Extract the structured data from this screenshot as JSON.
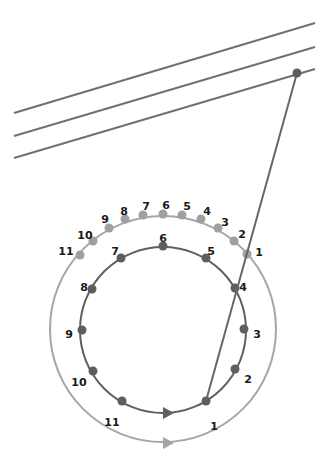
{
  "diagram": {
    "colors": {
      "background": "#ffffff",
      "parallel_lines": "#707070",
      "inner_circle": "#606060",
      "inner_dots": "#5e5e5e",
      "outer_circle": "#a6a6a6",
      "outer_dots": "#a0a0a0",
      "connector": "#666666",
      "label": "#1a1a1a"
    },
    "parallel_lines": [
      {
        "x1": 14,
        "y1": 113,
        "x2": 315,
        "y2": 23
      },
      {
        "x1": 14,
        "y1": 136,
        "x2": 315,
        "y2": 47
      },
      {
        "x1": 14,
        "y1": 158,
        "x2": 315,
        "y2": 69
      }
    ],
    "connector": {
      "x1": 297,
      "y1": 73,
      "x2": 206,
      "y2": 401,
      "top_dot": {
        "x": 297,
        "y": 73
      }
    },
    "inner_circle": {
      "cx": 163,
      "cy": 330,
      "r": 83,
      "points": [
        {
          "label": "1",
          "x": 206,
          "y": 401,
          "lx": 214,
          "ly": 426
        },
        {
          "label": "2",
          "x": 235,
          "y": 369,
          "lx": 248,
          "ly": 379
        },
        {
          "label": "3",
          "x": 244,
          "y": 329,
          "lx": 257,
          "ly": 334
        },
        {
          "label": "4",
          "x": 235,
          "y": 288,
          "lx": 243,
          "ly": 287
        },
        {
          "label": "5",
          "x": 206,
          "y": 258,
          "lx": 211,
          "ly": 251
        },
        {
          "label": "6",
          "x": 163,
          "y": 246,
          "lx": 163,
          "ly": 238
        },
        {
          "label": "7",
          "x": 121,
          "y": 258,
          "lx": 115,
          "ly": 251
        },
        {
          "label": "8",
          "x": 92,
          "y": 289,
          "lx": 84,
          "ly": 287
        },
        {
          "label": "9",
          "x": 82,
          "y": 330,
          "lx": 69,
          "ly": 334
        },
        {
          "label": "10",
          "x": 93,
          "y": 371,
          "lx": 79,
          "ly": 382
        },
        {
          "label": "",
          "x": 122,
          "y": 401,
          "lx": 0,
          "ly": 0
        }
      ],
      "arrow": {
        "x": 168,
        "y": 413
      }
    },
    "outer_circle": {
      "cx": 163,
      "cy": 329,
      "r": 113,
      "points": [
        {
          "label": "1",
          "x": 247,
          "y": 254,
          "lx": 259,
          "ly": 252
        },
        {
          "label": "2",
          "x": 234,
          "y": 241,
          "lx": 242,
          "ly": 234
        },
        {
          "label": "3",
          "x": 218,
          "y": 228,
          "lx": 225,
          "ly": 222
        },
        {
          "label": "4",
          "x": 201,
          "y": 219,
          "lx": 207,
          "ly": 211
        },
        {
          "label": "5",
          "x": 182,
          "y": 215,
          "lx": 187,
          "ly": 206
        },
        {
          "label": "6",
          "x": 163,
          "y": 214,
          "lx": 166,
          "ly": 205
        },
        {
          "label": "7",
          "x": 143,
          "y": 215,
          "lx": 146,
          "ly": 206
        },
        {
          "label": "8",
          "x": 125,
          "y": 219,
          "lx": 124,
          "ly": 211
        },
        {
          "label": "9",
          "x": 109,
          "y": 228,
          "lx": 105,
          "ly": 219
        },
        {
          "label": "10",
          "x": 93,
          "y": 241,
          "lx": 85,
          "ly": 235
        },
        {
          "label": "11",
          "x": 80,
          "y": 255,
          "lx": 66,
          "ly": 251
        }
      ],
      "arrow": {
        "x": 168,
        "y": 443
      },
      "extra_label": {
        "label": "11",
        "lx": 112,
        "ly": 426
      }
    }
  }
}
